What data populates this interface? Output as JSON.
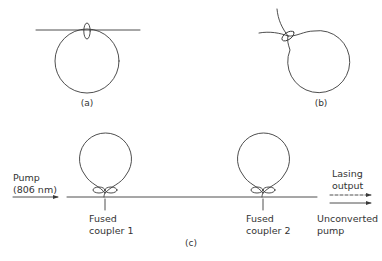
{
  "panels": {
    "a": {
      "caption": "(a)"
    },
    "b": {
      "caption": "(b)"
    },
    "c": {
      "caption": "(c)",
      "input": {
        "line1": "Pump",
        "line2": "(806 nm)"
      },
      "couplers": [
        {
          "line1": "Fused",
          "line2": "coupler 1"
        },
        {
          "line1": "Fused",
          "line2": "coupler 2"
        }
      ],
      "outputs": {
        "lasing": {
          "line1": "Lasing",
          "line2": "output",
          "style": "dashed"
        },
        "pump": {
          "line1": "Unconverted",
          "line2": "pump",
          "style": "solid"
        }
      }
    }
  },
  "colors": {
    "line": "#3a3a3a",
    "text": "#333333",
    "background": "#ffffff"
  }
}
